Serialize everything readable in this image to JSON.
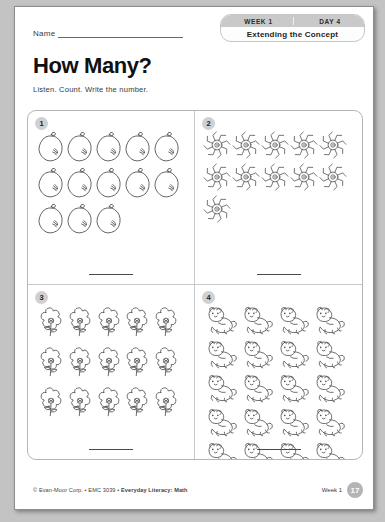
{
  "page": {
    "name_label": "Name",
    "title": "How Many?",
    "instructions": "Listen. Count. Write the number."
  },
  "badge": {
    "week": "WEEK 1",
    "day": "DAY 4",
    "lesson": "Extending the Concept"
  },
  "exercises": [
    {
      "number": "1",
      "icon": "lemon-fruit-icon",
      "count": 13,
      "per_row": 5,
      "item_size": 28,
      "answer": ""
    },
    {
      "number": "2",
      "icon": "spider-icon",
      "count": 11,
      "per_row": 5,
      "item_size": 28,
      "answer": ""
    },
    {
      "number": "3",
      "icon": "flower-icon",
      "count": 15,
      "per_row": 5,
      "item_size": 30,
      "answer": ""
    },
    {
      "number": "4",
      "icon": "bear-icon",
      "count": 20,
      "per_row": 4,
      "item_size": 30,
      "answer": ""
    }
  ],
  "footer": {
    "copyright_pre": "© Evan-Moor Corp. • EMC 3039 • ",
    "copyright_bold": "Everyday Literacy: Math",
    "week": "Week 1",
    "page_number": "17"
  },
  "colors": {
    "badge_bar": "#c9c9c9",
    "page_badge": "#b4b4b4",
    "ink": "#555555"
  }
}
